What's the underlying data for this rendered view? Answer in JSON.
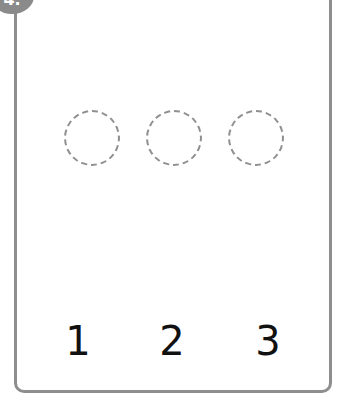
{
  "badge": {
    "label": "4."
  },
  "circles": [
    {
      "label": ""
    },
    {
      "label": ""
    },
    {
      "label": ""
    }
  ],
  "numbers": [
    "1",
    "2",
    "3"
  ],
  "colors": {
    "border": "#8e8e8e",
    "dashed_circle": "#8f8f8f",
    "text": "#111111"
  }
}
